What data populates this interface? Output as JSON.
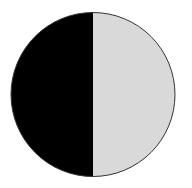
{
  "diagram": {
    "type": "half-shaded-circle",
    "shape": {
      "cx": 93,
      "cy": 94.5,
      "r": 82
    },
    "colors": {
      "background": "#ffffff",
      "left_half": "#000000",
      "right_half": "#d9d9d9",
      "outline": "#333333"
    },
    "halves": [
      {
        "side": "left",
        "fill": "black"
      },
      {
        "side": "right",
        "fill": "light-gray"
      }
    ]
  }
}
